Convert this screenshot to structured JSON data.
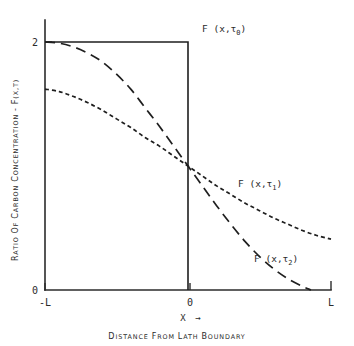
{
  "chart_data": {
    "type": "line",
    "title": "",
    "xlabel": "Distance from Lath Boundary",
    "xlabel_inline": "X",
    "xlabel_arrow": "→",
    "ylabel": "Ratio of Carbon Concentration - F(x,τ)",
    "xlim": [
      -1,
      1
    ],
    "ylim": [
      0,
      2
    ],
    "grid": false,
    "legend_position": "inline-annotations",
    "x_tick_labels": [
      "-L",
      "0",
      "L"
    ],
    "x_tick_values": [
      -1,
      0,
      1
    ],
    "y_tick_labels": [
      "2",
      "0"
    ],
    "y_tick_values": [
      2,
      0
    ],
    "series": [
      {
        "name": "F (x,τ₀)",
        "label_base": "F (x,τ",
        "label_sub": "0",
        "label_close": ")",
        "style": "solid",
        "description": "Initial step profile: constant 2 for x<0, drops to 0 at x=0",
        "points": [
          [
            -1,
            2
          ],
          [
            -0.5,
            2
          ],
          [
            -0.001,
            2
          ],
          [
            0,
            2
          ],
          [
            0,
            1
          ],
          [
            0,
            0
          ]
        ]
      },
      {
        "name": "F (x,τ₁)",
        "label_base": "F (x,τ",
        "label_sub": "1",
        "label_close": ")",
        "style": "short-dash",
        "description": "Long-time diffused profile: shallow sigmoid from 1.62 to 0.41",
        "points": [
          [
            -1.0,
            1.62
          ],
          [
            -0.9,
            1.6
          ],
          [
            -0.8,
            1.56
          ],
          [
            -0.7,
            1.51
          ],
          [
            -0.6,
            1.45
          ],
          [
            -0.5,
            1.38
          ],
          [
            -0.4,
            1.31
          ],
          [
            -0.3,
            1.23
          ],
          [
            -0.2,
            1.16
          ],
          [
            -0.1,
            1.08
          ],
          [
            0.0,
            1.0
          ],
          [
            0.1,
            0.92
          ],
          [
            0.2,
            0.84
          ],
          [
            0.3,
            0.77
          ],
          [
            0.4,
            0.7
          ],
          [
            0.5,
            0.64
          ],
          [
            0.6,
            0.58
          ],
          [
            0.7,
            0.53
          ],
          [
            0.8,
            0.48
          ],
          [
            0.9,
            0.44
          ],
          [
            1.0,
            0.41
          ]
        ]
      },
      {
        "name": "F (x,τ₂)",
        "label_base": "F (x,τ",
        "label_sub": "2",
        "label_close": ")",
        "style": "long-dash",
        "description": "Short-time diffused profile: steep sigmoid from 2.0 to 0.0",
        "points": [
          [
            -1.0,
            2.0
          ],
          [
            -0.9,
            1.99
          ],
          [
            -0.8,
            1.96
          ],
          [
            -0.7,
            1.91
          ],
          [
            -0.6,
            1.84
          ],
          [
            -0.5,
            1.74
          ],
          [
            -0.4,
            1.62
          ],
          [
            -0.3,
            1.47
          ],
          [
            -0.2,
            1.32
          ],
          [
            -0.1,
            1.16
          ],
          [
            0.0,
            1.0
          ],
          [
            0.1,
            0.84
          ],
          [
            0.2,
            0.68
          ],
          [
            0.3,
            0.53
          ],
          [
            0.4,
            0.39
          ],
          [
            0.5,
            0.27
          ],
          [
            0.6,
            0.17
          ],
          [
            0.7,
            0.09
          ],
          [
            0.8,
            0.03
          ],
          [
            0.86,
            0.0
          ]
        ]
      }
    ],
    "annotations": [
      {
        "text": "F (x,τ₀)",
        "x": 0.09,
        "y": 2.06
      },
      {
        "text": "F (x,τ₁)",
        "x": 0.45,
        "y": 0.83
      },
      {
        "text": "F (x,τ₂)",
        "x": 0.62,
        "y": 0.27
      }
    ]
  }
}
